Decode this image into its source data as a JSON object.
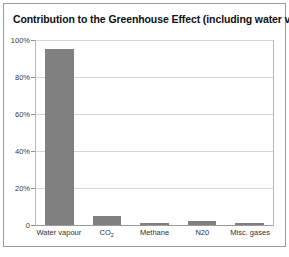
{
  "chart_data": {
    "type": "bar",
    "title": "Contribution to the Greenhouse Effect (including water vapour)",
    "xlabel": "",
    "ylabel": "",
    "categories": [
      "Water vapour",
      "CO2",
      "Methane",
      "N20",
      "Misc. gases"
    ],
    "values": [
      95,
      5,
      1,
      2,
      1
    ],
    "ylim": [
      0,
      100
    ],
    "yticks": [
      100,
      80,
      60,
      40,
      20,
      0
    ],
    "ytick_labels": [
      "100%",
      "80%",
      "60%",
      "40%",
      "20%",
      "0"
    ],
    "grid": true,
    "legend": "none",
    "bar_color": "#808080",
    "gridline_color": "#d5d5d5",
    "axis_color": "#9a9a9a",
    "background_color": "#ffffff",
    "series": [
      {
        "name": "Contribution",
        "values": [
          95,
          5,
          1,
          2,
          1
        ]
      }
    ]
  },
  "category_labels": {
    "water_vapour": "Water vapour",
    "co2_main": "CO",
    "co2_sub": "2",
    "methane": "Methane",
    "n20": "N20",
    "misc_gases": "Misc. gases"
  }
}
